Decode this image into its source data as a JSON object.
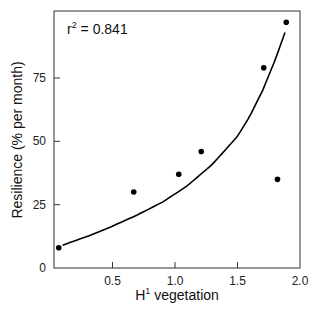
{
  "chart_data": {
    "type": "scatter",
    "title": "",
    "xlabel": "H¹ vegetation",
    "xlabel_base": "H",
    "xlabel_sup": "1",
    "xlabel_rest": " vegetation",
    "ylabel": "Resilience (% per month)",
    "xlim": [
      0,
      2.0
    ],
    "ylim": [
      0,
      100
    ],
    "xticks": [
      0.5,
      1.0,
      1.5,
      2.0
    ],
    "xtick_labels": [
      "0.5",
      "1.0",
      "1.5",
      "2.0"
    ],
    "yticks": [
      0,
      25,
      50,
      75
    ],
    "ytick_labels": [
      "0",
      "25",
      "50",
      "75"
    ],
    "grid": false,
    "legend": null,
    "annotation": {
      "text": "r² = 0.841",
      "base": "r",
      "sup": "2",
      "rest": " = 0.841"
    },
    "series": [
      {
        "name": "observations",
        "type": "scatter",
        "x": [
          0.07,
          0.67,
          1.03,
          1.21,
          1.71,
          1.82,
          1.89
        ],
        "y": [
          8,
          30,
          37,
          46,
          79,
          35,
          97
        ]
      },
      {
        "name": "fitted curve",
        "type": "line",
        "x": [
          0.1,
          0.3,
          0.5,
          0.7,
          0.9,
          1.1,
          1.3,
          1.5,
          1.6,
          1.7,
          1.8,
          1.88
        ],
        "y": [
          9,
          12.5,
          16.5,
          21,
          26,
          32.5,
          41,
          52,
          60,
          70,
          82,
          93
        ]
      }
    ]
  },
  "colors": {
    "axis": "#333333",
    "points": "#000000",
    "curve": "#000000"
  }
}
